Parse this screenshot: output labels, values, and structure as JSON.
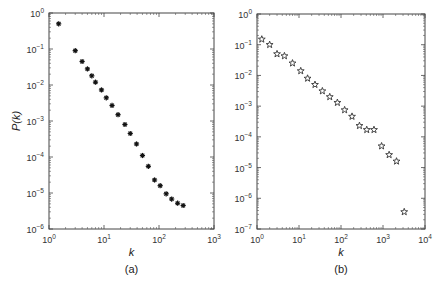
{
  "chart_data": [
    {
      "id": "a",
      "type": "scatter",
      "caption": "(a)",
      "xlabel": "k",
      "ylabel": "P(k)",
      "xscale": "log",
      "yscale": "log",
      "xlim": [
        1,
        1000
      ],
      "ylim": [
        1e-06,
        1
      ],
      "x_ticks": [
        "10^0",
        "10^1",
        "10^2",
        "10^3"
      ],
      "y_ticks": [
        "10^0",
        "10^-1",
        "10^-2",
        "10^-3",
        "10^-4",
        "10^-5",
        "10^-6"
      ],
      "marker": "asterisk",
      "grid": false,
      "legend": null,
      "points": [
        {
          "k": 1.5,
          "P": 0.5
        },
        {
          "k": 3,
          "P": 0.09
        },
        {
          "k": 4,
          "P": 0.045
        },
        {
          "k": 5,
          "P": 0.028
        },
        {
          "k": 6,
          "P": 0.018
        },
        {
          "k": 7,
          "P": 0.012
        },
        {
          "k": 9,
          "P": 0.0073
        },
        {
          "k": 11,
          "P": 0.0044
        },
        {
          "k": 14,
          "P": 0.0027
        },
        {
          "k": 18,
          "P": 0.0015
        },
        {
          "k": 24,
          "P": 0.0008
        },
        {
          "k": 30,
          "P": 0.00045
        },
        {
          "k": 39,
          "P": 0.00023
        },
        {
          "k": 50,
          "P": 0.00011
        },
        {
          "k": 64,
          "P": 5.5e-05
        },
        {
          "k": 83,
          "P": 2.3e-05
        },
        {
          "k": 105,
          "P": 1.6e-05
        },
        {
          "k": 135,
          "P": 9.5e-06
        },
        {
          "k": 170,
          "P": 6.8e-06
        },
        {
          "k": 218,
          "P": 5.2e-06
        },
        {
          "k": 275,
          "P": 4.5e-06
        }
      ]
    },
    {
      "id": "b",
      "type": "scatter",
      "caption": "(b)",
      "xlabel": "k",
      "ylabel": "",
      "xscale": "log",
      "yscale": "log",
      "xlim": [
        1,
        10000
      ],
      "ylim": [
        1e-07,
        1
      ],
      "x_ticks": [
        "10^0",
        "10^1",
        "10^2",
        "10^3",
        "10^4"
      ],
      "y_ticks": [
        "10^0",
        "10^-1",
        "10^-2",
        "10^-3",
        "10^-4",
        "10^-5",
        "10^-6",
        "10^-7"
      ],
      "marker": "star",
      "grid": false,
      "legend": null,
      "points": [
        {
          "k": 1.3,
          "P": 0.15
        },
        {
          "k": 2,
          "P": 0.1
        },
        {
          "k": 3,
          "P": 0.05
        },
        {
          "k": 4.5,
          "P": 0.043
        },
        {
          "k": 7,
          "P": 0.025
        },
        {
          "k": 11,
          "P": 0.014
        },
        {
          "k": 16,
          "P": 0.008
        },
        {
          "k": 24,
          "P": 0.005
        },
        {
          "k": 36,
          "P": 0.0031
        },
        {
          "k": 54,
          "P": 0.002
        },
        {
          "k": 82,
          "P": 0.0013
        },
        {
          "k": 122,
          "P": 0.00075
        },
        {
          "k": 183,
          "P": 0.00046
        },
        {
          "k": 275,
          "P": 0.00023
        },
        {
          "k": 410,
          "P": 0.00017
        },
        {
          "k": 610,
          "P": 0.00017
        },
        {
          "k": 925,
          "P": 5e-05
        },
        {
          "k": 1400,
          "P": 2.6e-05
        },
        {
          "k": 2100,
          "P": 1.6e-05
        },
        {
          "k": 3200,
          "P": 3.6e-07
        }
      ]
    }
  ]
}
